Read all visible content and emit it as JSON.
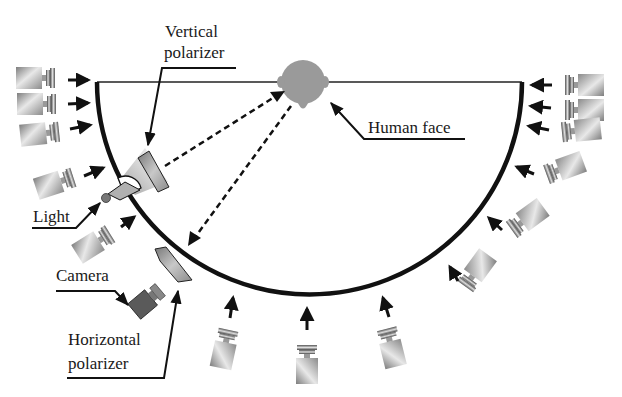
{
  "diagram": {
    "type": "light-stage-capture-setup",
    "labels": {
      "vertical_polarizer_line1": "Vertical",
      "vertical_polarizer_line2": "polarizer",
      "human_face": "Human face",
      "light": "Light",
      "camera": "Camera",
      "horizontal_polarizer_line1": "Horizontal",
      "horizontal_polarizer_line2": "polarizer"
    },
    "arc": {
      "center": [
        304,
        82
      ],
      "radius": 212,
      "color": "#111111"
    },
    "face": {
      "center": [
        303,
        84
      ],
      "color": "#9a9a9a"
    },
    "surrounding_cameras": {
      "left_count": 5,
      "right_count": 6,
      "bottom_count": 3,
      "total": 14
    },
    "colors": {
      "stroke": "#111111",
      "face_gray": "#9a9a9a",
      "camera_body_light": "#e6e6e6",
      "camera_body_dark": "#7a7a7a",
      "main_camera": "#555555",
      "polarizer": "#9c9c9c",
      "light_cone": "#b5b5b5"
    }
  }
}
